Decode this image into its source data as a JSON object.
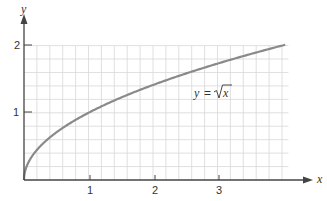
{
  "chart_data": {
    "type": "line",
    "title": "",
    "xlabel": "x",
    "ylabel": "y",
    "xlim": [
      0,
      4.1
    ],
    "ylim": [
      0,
      2.0
    ],
    "xticks": [
      1,
      2,
      3
    ],
    "yticks": [
      1,
      2
    ],
    "xtick_labels": [
      "1",
      "2",
      "3"
    ],
    "ytick_labels": [
      "1",
      "2"
    ],
    "grid": true,
    "grid_step": 0.2,
    "series": [
      {
        "name": "y = √x",
        "function": "sqrt(x)",
        "x": [
          0,
          0.25,
          0.5,
          1,
          1.5,
          2,
          2.5,
          3,
          3.5,
          4
        ],
        "y": [
          0,
          0.5,
          0.707,
          1,
          1.225,
          1.414,
          1.581,
          1.732,
          1.871,
          2
        ]
      }
    ],
    "annotations": [
      {
        "text": "y = √x",
        "x": 2.6,
        "y": 1.35
      }
    ]
  },
  "colors": {
    "curve": "#8a8a8a",
    "axis": "#444444",
    "grid": "#d8d8d8"
  },
  "labels": {
    "x_axis": "x",
    "y_axis": "y",
    "annotation_lhs": "y",
    "annotation_eq": "=",
    "annotation_rhs": "x",
    "tick_x1": "1",
    "tick_x2": "2",
    "tick_x3": "3",
    "tick_y1": "1",
    "tick_y2": "2"
  }
}
